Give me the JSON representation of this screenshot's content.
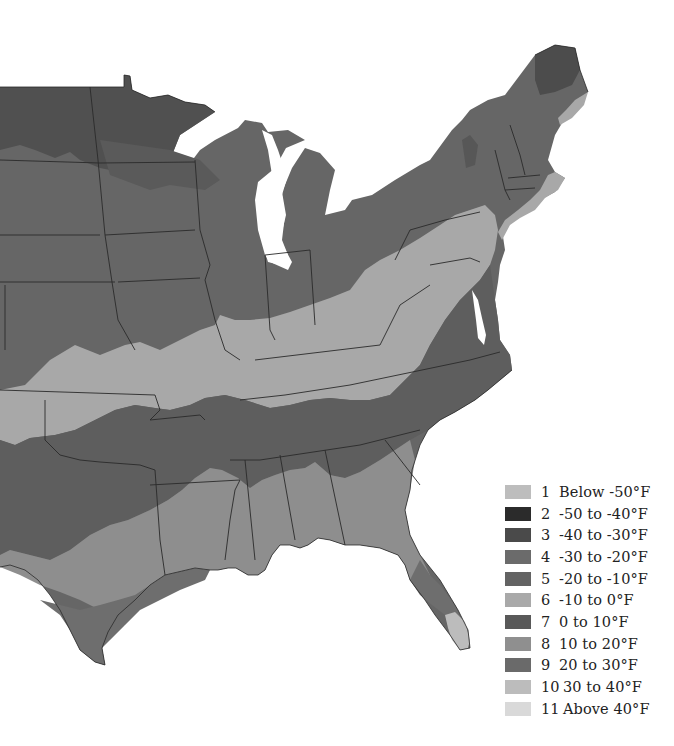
{
  "map": {
    "subject": "Plant hardiness zones - eastern United States",
    "style": "grayscale",
    "colors": {
      "background": "#ffffff",
      "water": "#ffffff",
      "state_border": "#2a2a2a",
      "zone_3": "#4f4f4f",
      "zone_4": "#6a6a6a",
      "zone_5": "#666666",
      "zone_6": "#a8a8a8",
      "zone_7": "#5e5e5e",
      "zone_8": "#8e8e8e",
      "zone_9": "#6e6e6e",
      "zone_10": "#bcbcbc"
    }
  },
  "legend": {
    "items": [
      {
        "zone": "1",
        "label": "Below -50°F",
        "color": "#bdbdbd"
      },
      {
        "zone": "2",
        "label": "-50 to -40°F",
        "color": "#2b2b2b"
      },
      {
        "zone": "3",
        "label": "-40 to -30°F",
        "color": "#4a4a4a"
      },
      {
        "zone": "4",
        "label": "-30 to -20°F",
        "color": "#6b6b6b"
      },
      {
        "zone": "5",
        "label": "-20 to -10°F",
        "color": "#636363"
      },
      {
        "zone": "6",
        "label": "-10 to 0°F",
        "color": "#a9a9a9"
      },
      {
        "zone": "7",
        "label": "0 to 10°F",
        "color": "#595959"
      },
      {
        "zone": "8",
        "label": "10 to 20°F",
        "color": "#8f8f8f"
      },
      {
        "zone": "9",
        "label": "20 to 30°F",
        "color": "#6a6a6a"
      },
      {
        "zone": "10",
        "label": "30 to 40°F",
        "color": "#bcbcbc"
      },
      {
        "zone": "11",
        "label": "Above 40°F",
        "color": "#d9d9d9"
      }
    ]
  }
}
